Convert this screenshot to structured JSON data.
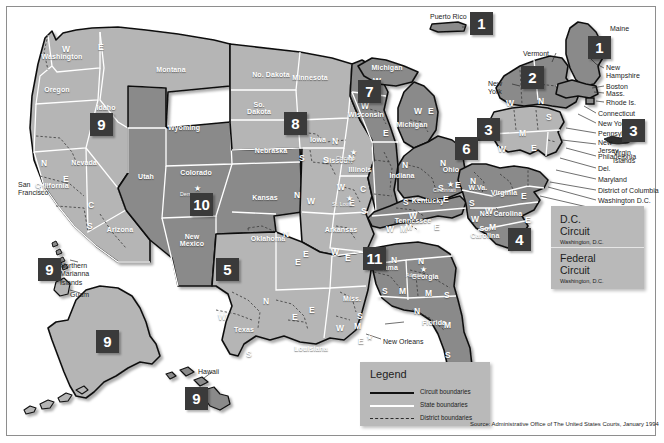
{
  "source": "Source: Administrative Office of The United States Courts, January 1994",
  "colors": {
    "circuit_light": "#b5b5b5",
    "circuit_dark": "#8a8a8a",
    "badge_bg": "#3a3a3a",
    "badge_text": "#ffffff",
    "panel_bg": "#b9b9b9",
    "boundary_circuit": "#111111",
    "boundary_state": "#ffffff",
    "page_bg": "#ffffff"
  },
  "legend": {
    "title": "Legend",
    "items": [
      {
        "label": "Circuit boundaries",
        "style": "solid-black",
        "icon": "line-solid-black-icon"
      },
      {
        "label": "State boundaries",
        "style": "solid-white",
        "icon": "line-solid-white-icon"
      },
      {
        "label": "District boundaries",
        "style": "dashed",
        "icon": "line-dashed-icon"
      }
    ]
  },
  "special_courts": [
    {
      "name": "D.C.\nCircuit",
      "location": "Washington, D.C."
    },
    {
      "name": "Federal\nCircuit",
      "location": "Washington, D.C."
    }
  ],
  "circuit_badges": [
    {
      "number": "1",
      "for": "Puerto Rico",
      "x": 470,
      "y": 12,
      "size": "lg"
    },
    {
      "number": "1",
      "for": "Maine / New England",
      "x": 588,
      "y": 36,
      "size": "lg"
    },
    {
      "number": "2",
      "for": "New York / Vermont / Connecticut",
      "x": 521,
      "y": 66,
      "size": "lg"
    },
    {
      "number": "3",
      "for": "Pennsylvania / New Jersey / Delaware",
      "x": 477,
      "y": 118,
      "size": "lg"
    },
    {
      "number": "3",
      "for": "Virgin Islands",
      "x": 622,
      "y": 119,
      "size": "lg"
    },
    {
      "number": "4",
      "for": "Maryland / Virginia / Carolinas",
      "x": 508,
      "y": 228,
      "size": "lg"
    },
    {
      "number": "5",
      "for": "Texas / Louisiana / Mississippi",
      "x": 216,
      "y": 258,
      "size": "lg"
    },
    {
      "number": "6",
      "for": "Michigan / Ohio / Kentucky / Tennessee",
      "x": 455,
      "y": 137,
      "size": "lg"
    },
    {
      "number": "7",
      "for": "Illinois / Indiana / Wisconsin",
      "x": 358,
      "y": 80,
      "size": "lg"
    },
    {
      "number": "8",
      "for": "Dakotas / Nebraska / Iowa / Missouri / Arkansas",
      "x": 284,
      "y": 112,
      "size": "lg"
    },
    {
      "number": "9",
      "for": "Pacific West",
      "x": 90,
      "y": 113,
      "size": "lg"
    },
    {
      "number": "9",
      "for": "Northern Mariana Islands / Guam",
      "x": 38,
      "y": 258,
      "size": "lg"
    },
    {
      "number": "9",
      "for": "Alaska",
      "x": 96,
      "y": 330,
      "size": "lg"
    },
    {
      "number": "9",
      "for": "Hawaii",
      "x": 185,
      "y": 387,
      "size": "lg"
    },
    {
      "number": "10",
      "for": "Colorado / Utah / Wyoming / Kansas / New Mexico / Oklahoma",
      "x": 190,
      "y": 193,
      "size": "lg"
    },
    {
      "number": "11",
      "for": "Alabama / Georgia / Florida",
      "x": 363,
      "y": 247,
      "size": "lg"
    }
  ],
  "state_labels": [
    {
      "name": "Washington",
      "x": 62,
      "y": 57
    },
    {
      "name": "Oregon",
      "x": 57,
      "y": 90
    },
    {
      "name": "Idaho",
      "x": 106,
      "y": 108
    },
    {
      "name": "Montana",
      "x": 171,
      "y": 70
    },
    {
      "name": "Wyoming",
      "x": 184,
      "y": 128
    },
    {
      "name": "Nevada",
      "x": 84,
      "y": 163
    },
    {
      "name": "California",
      "x": 52,
      "y": 186
    },
    {
      "name": "Utah",
      "x": 146,
      "y": 177
    },
    {
      "name": "Colorado",
      "x": 196,
      "y": 173
    },
    {
      "name": "Arizona",
      "x": 120,
      "y": 230
    },
    {
      "name": "New\nMexico",
      "x": 192,
      "y": 240
    },
    {
      "name": "No. Dakota",
      "x": 271,
      "y": 75
    },
    {
      "name": "So.\nDakota",
      "x": 259,
      "y": 108
    },
    {
      "name": "Nebraska",
      "x": 271,
      "y": 151
    },
    {
      "name": "Minnesota",
      "x": 310,
      "y": 78
    },
    {
      "name": "Iowa",
      "x": 318,
      "y": 140
    },
    {
      "name": "Kansas",
      "x": 265,
      "y": 198
    },
    {
      "name": "Oklahoma",
      "x": 268,
      "y": 239
    },
    {
      "name": "Texas",
      "x": 244,
      "y": 330
    },
    {
      "name": "Missouri",
      "x": 338,
      "y": 161
    },
    {
      "name": "Arkansas",
      "x": 341,
      "y": 230
    },
    {
      "name": "Louisiana",
      "x": 311,
      "y": 349
    },
    {
      "name": "Miss.",
      "x": 352,
      "y": 299
    },
    {
      "name": "Wisconsin",
      "x": 366,
      "y": 115
    },
    {
      "name": "Illinois",
      "x": 360,
      "y": 170
    },
    {
      "name": "Michigan",
      "x": 412,
      "y": 125
    },
    {
      "name": "Indiana",
      "x": 402,
      "y": 176
    },
    {
      "name": "Ohio",
      "x": 451,
      "y": 170
    },
    {
      "name": "Kentucky",
      "x": 428,
      "y": 201
    },
    {
      "name": "Tennessee",
      "x": 413,
      "y": 221
    },
    {
      "name": "Alabama",
      "x": 383,
      "y": 268
    },
    {
      "name": "Georgia",
      "x": 425,
      "y": 277
    },
    {
      "name": "Florida",
      "x": 434,
      "y": 323
    },
    {
      "name": "W.Va.",
      "x": 478,
      "y": 188
    },
    {
      "name": "Virginia",
      "x": 504,
      "y": 193
    },
    {
      "name": "No. Carolina",
      "x": 501,
      "y": 214
    },
    {
      "name": "So.\nCarolina",
      "x": 485,
      "y": 232
    },
    {
      "name": "Michigan",
      "x": 387,
      "y": 68
    }
  ],
  "district_letters": [
    {
      "letter": "W",
      "x": 62,
      "y": 44
    },
    {
      "letter": "E",
      "x": 98,
      "y": 42
    },
    {
      "letter": "N",
      "x": 41,
      "y": 158
    },
    {
      "letter": "E",
      "x": 63,
      "y": 174
    },
    {
      "letter": "C",
      "x": 88,
      "y": 200
    },
    {
      "letter": "S",
      "x": 87,
      "y": 221
    },
    {
      "letter": "S",
      "x": 299,
      "y": 153
    },
    {
      "letter": "N",
      "x": 332,
      "y": 136
    },
    {
      "letter": "S",
      "x": 323,
      "y": 155
    },
    {
      "letter": "W",
      "x": 307,
      "y": 196
    },
    {
      "letter": "N",
      "x": 294,
      "y": 190
    },
    {
      "letter": "E",
      "x": 303,
      "y": 249
    },
    {
      "letter": "N",
      "x": 283,
      "y": 229
    },
    {
      "letter": "E",
      "x": 295,
      "y": 257
    },
    {
      "letter": "N",
      "x": 263,
      "y": 296
    },
    {
      "letter": "W",
      "x": 218,
      "y": 312
    },
    {
      "letter": "E",
      "x": 292,
      "y": 312
    },
    {
      "letter": "S",
      "x": 246,
      "y": 349
    },
    {
      "letter": "W",
      "x": 336,
      "y": 323
    },
    {
      "letter": "M",
      "x": 354,
      "y": 321
    },
    {
      "letter": "E",
      "x": 358,
      "y": 336
    },
    {
      "letter": "E",
      "x": 309,
      "y": 305
    },
    {
      "letter": "S",
      "x": 357,
      "y": 311
    },
    {
      "letter": "W",
      "x": 337,
      "y": 182
    },
    {
      "letter": "E",
      "x": 349,
      "y": 198
    },
    {
      "letter": "W",
      "x": 331,
      "y": 247
    },
    {
      "letter": "E",
      "x": 345,
      "y": 253
    },
    {
      "letter": "W",
      "x": 361,
      "y": 101
    },
    {
      "letter": "E",
      "x": 383,
      "y": 128
    },
    {
      "letter": "N",
      "x": 348,
      "y": 153
    },
    {
      "letter": "C",
      "x": 360,
      "y": 184
    },
    {
      "letter": "S",
      "x": 361,
      "y": 206
    },
    {
      "letter": "W",
      "x": 373,
      "y": 76
    },
    {
      "letter": "W",
      "x": 414,
      "y": 106
    },
    {
      "letter": "E",
      "x": 428,
      "y": 106
    },
    {
      "letter": "N",
      "x": 402,
      "y": 160
    },
    {
      "letter": "S",
      "x": 403,
      "y": 197
    },
    {
      "letter": "N",
      "x": 440,
      "y": 158
    },
    {
      "letter": "S",
      "x": 438,
      "y": 183
    },
    {
      "letter": "E",
      "x": 443,
      "y": 194
    },
    {
      "letter": "W",
      "x": 409,
      "y": 211
    },
    {
      "letter": "M",
      "x": 405,
      "y": 222
    },
    {
      "letter": "E",
      "x": 434,
      "y": 222
    },
    {
      "letter": "W",
      "x": 386,
      "y": 224
    },
    {
      "letter": "M",
      "x": 400,
      "y": 224
    },
    {
      "letter": "N",
      "x": 391,
      "y": 255
    },
    {
      "letter": "S",
      "x": 382,
      "y": 286
    },
    {
      "letter": "M",
      "x": 399,
      "y": 286
    },
    {
      "letter": "N",
      "x": 418,
      "y": 256
    },
    {
      "letter": "M",
      "x": 425,
      "y": 288
    },
    {
      "letter": "S",
      "x": 444,
      "y": 290
    },
    {
      "letter": "N",
      "x": 414,
      "y": 306
    },
    {
      "letter": "M",
      "x": 444,
      "y": 320
    },
    {
      "letter": "S",
      "x": 445,
      "y": 350
    },
    {
      "letter": "N",
      "x": 470,
      "y": 176
    },
    {
      "letter": "S",
      "x": 469,
      "y": 198
    },
    {
      "letter": "W",
      "x": 485,
      "y": 206
    },
    {
      "letter": "E",
      "x": 521,
      "y": 191
    },
    {
      "letter": "W",
      "x": 471,
      "y": 214
    },
    {
      "letter": "M",
      "x": 489,
      "y": 222
    },
    {
      "letter": "E",
      "x": 525,
      "y": 215
    },
    {
      "letter": "W",
      "x": 498,
      "y": 144
    },
    {
      "letter": "M",
      "x": 519,
      "y": 128
    },
    {
      "letter": "E",
      "x": 531,
      "y": 143
    },
    {
      "letter": "W",
      "x": 506,
      "y": 98
    },
    {
      "letter": "N",
      "x": 538,
      "y": 96
    },
    {
      "letter": "S",
      "x": 546,
      "y": 112
    },
    {
      "letter": "E",
      "x": 455,
      "y": 180
    }
  ],
  "callouts": [
    {
      "label": "Maine",
      "x": 610,
      "y": 25
    },
    {
      "label": "Vermont",
      "x": 523,
      "y": 50
    },
    {
      "label": "New\nYork",
      "x": 488,
      "y": 80
    },
    {
      "label": "New\nHampshire",
      "x": 606,
      "y": 64
    },
    {
      "label": "Boston",
      "x": 606,
      "y": 83
    },
    {
      "label": "Mass.",
      "x": 606,
      "y": 90
    },
    {
      "label": "Rhode Is.",
      "x": 606,
      "y": 99
    },
    {
      "label": "Connecticut",
      "x": 598,
      "y": 110
    },
    {
      "label": "New York",
      "x": 598,
      "y": 120
    },
    {
      "label": "Pennsylvania",
      "x": 598,
      "y": 130
    },
    {
      "label": "New\nJersey",
      "x": 598,
      "y": 139
    },
    {
      "label": "Philadelphia",
      "x": 598,
      "y": 153
    },
    {
      "label": "Del.",
      "x": 598,
      "y": 165
    },
    {
      "label": "Maryland",
      "x": 598,
      "y": 176
    },
    {
      "label": "District of Columbia",
      "x": 598,
      "y": 187
    },
    {
      "label": "Washington D.C.",
      "x": 598,
      "y": 197
    },
    {
      "label": "Richmond",
      "x": 598,
      "y": 206
    },
    {
      "label": "New Orleans",
      "x": 383,
      "y": 338
    },
    {
      "label": "Puerto Rico",
      "x": 430,
      "y": 13
    },
    {
      "label": "Virgin\nIslands",
      "x": 613,
      "y": 149
    },
    {
      "label": "Northern\nMarianna\nIslands",
      "x": 60,
      "y": 262
    },
    {
      "label": "Guam",
      "x": 70,
      "y": 291
    },
    {
      "label": "Hawaii",
      "x": 198,
      "y": 368
    },
    {
      "label": "San\nFrancisco",
      "x": 18,
      "y": 181
    }
  ],
  "city_markers": [
    {
      "label": "San Francisco",
      "x": 38,
      "y": 186
    },
    {
      "label": "Denver",
      "x": 194,
      "y": 185
    },
    {
      "label": "St. Louis",
      "x": 346,
      "y": 195
    },
    {
      "label": "Chicago",
      "x": 350,
      "y": 149
    },
    {
      "label": "Cincinnati",
      "x": 447,
      "y": 181
    },
    {
      "label": "Atlanta",
      "x": 420,
      "y": 266
    },
    {
      "label": "New Orleans",
      "x": 366,
      "y": 334
    }
  ]
}
